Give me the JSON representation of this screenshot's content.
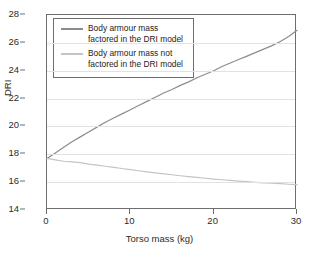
{
  "chart_data": {
    "type": "line",
    "title": "",
    "xlabel": "Torso mass (kg)",
    "ylabel": "DRI",
    "xlim": [
      0,
      30
    ],
    "ylim": [
      14,
      28
    ],
    "xticks": [
      0,
      10,
      20,
      30
    ],
    "yticks": [
      14,
      16,
      18,
      20,
      22,
      24,
      26,
      28
    ],
    "grid": "horizontal",
    "legend_position": "top-left inside axes",
    "series": [
      {
        "name": "Body armour mass factored in the DRI model",
        "legend_label_line1": "Body armour mass",
        "legend_label_line2": "factored in the DRI model",
        "color": "#8c8c8c",
        "x": [
          0,
          1,
          2,
          3,
          4,
          5,
          6,
          7,
          8,
          9,
          10,
          11,
          12,
          13,
          14,
          15,
          16,
          17,
          18,
          19,
          20,
          21,
          22,
          23,
          24,
          25,
          26,
          27,
          28,
          29,
          30
        ],
        "values": [
          17.7,
          18.1,
          18.5,
          18.9,
          19.25,
          19.6,
          19.95,
          20.3,
          20.6,
          20.9,
          21.2,
          21.5,
          21.8,
          22.1,
          22.4,
          22.65,
          22.95,
          23.2,
          23.5,
          23.75,
          24.0,
          24.3,
          24.55,
          24.8,
          25.05,
          25.3,
          25.55,
          25.8,
          26.1,
          26.45,
          26.9
        ]
      },
      {
        "name": "Body armour mass not factored in the DRI model",
        "legend_label_line1": "Body armour mass not",
        "legend_label_line2": "factored in the DRI model",
        "color": "#c4c4c4",
        "x": [
          0,
          1,
          2,
          3,
          4,
          5,
          6,
          7,
          8,
          9,
          10,
          11,
          12,
          13,
          14,
          15,
          16,
          17,
          18,
          19,
          20,
          21,
          22,
          23,
          24,
          25,
          26,
          27,
          28,
          29,
          30
        ],
        "values": [
          17.7,
          17.6,
          17.5,
          17.45,
          17.4,
          17.3,
          17.22,
          17.14,
          17.06,
          16.98,
          16.9,
          16.82,
          16.74,
          16.67,
          16.6,
          16.53,
          16.46,
          16.4,
          16.34,
          16.28,
          16.22,
          16.17,
          16.12,
          16.07,
          16.03,
          15.99,
          15.95,
          15.92,
          15.89,
          15.85,
          15.82
        ]
      }
    ]
  },
  "axes": {
    "y_title": "DRI",
    "x_title": "Torso mass (kg)"
  },
  "colors": {
    "series_dark": "#8c8c8c",
    "series_light": "#c4c4c4",
    "grid": "#e2e2e2",
    "frame": "#6e6e6e",
    "text": "#2b2b2b",
    "background": "#ffffff"
  }
}
